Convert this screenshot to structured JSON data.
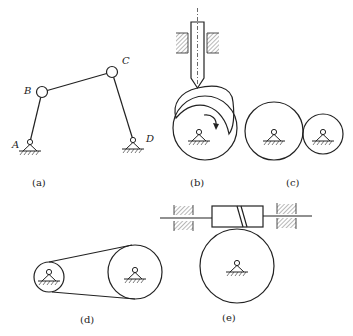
{
  "figure": {
    "panels": [
      {
        "id": "a",
        "caption": "(a)",
        "description": "four-bar linkage",
        "joints": [
          "A",
          "B",
          "C",
          "D"
        ]
      },
      {
        "id": "b",
        "caption": "(b)",
        "description": "cam and follower mechanism"
      },
      {
        "id": "c",
        "caption": "(c)",
        "description": "gear pair"
      },
      {
        "id": "d",
        "caption": "(d)",
        "description": "belt drive"
      },
      {
        "id": "e",
        "caption": "(e)",
        "description": "worm and wheel"
      }
    ],
    "labels": {
      "A": "A",
      "B": "B",
      "C": "C",
      "D": "D"
    },
    "colors": {
      "line": "#222222",
      "background": "#ffffff"
    }
  }
}
